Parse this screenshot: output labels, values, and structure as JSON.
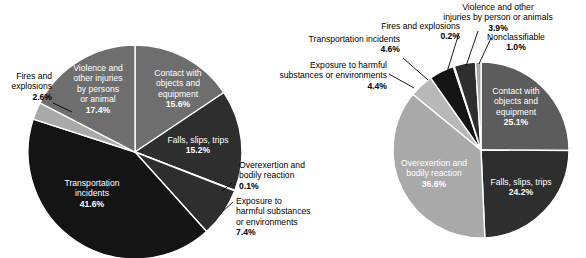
{
  "figure": {
    "name": "fatal-and-nonfatal-occupational-injury-event-distribution",
    "background": "#ffffff"
  },
  "colors": {
    "very_dark": "#141414",
    "dark": "#2e2e2e",
    "mid_dark": "#3d3d3d",
    "mid": "#5c5c5c",
    "mid_light": "#6e6e6e",
    "light": "#a9a9a9",
    "lighter": "#b8b8b8",
    "separator": "#ffffff",
    "text": "#000000",
    "inner_text": "#ffffff"
  },
  "chart_data": [
    {
      "type": "pie",
      "name": "left-pie",
      "title": "",
      "subtitle": "",
      "legend_position": "none",
      "grid": false,
      "center": {
        "x": 135,
        "y": 152
      },
      "radius": 107,
      "start_angle_deg": -90,
      "direction": "clockwise",
      "categories": [
        "Contact with objects and equipment",
        "Falls, slips, trips",
        "Overexertion and bodily reaction",
        "Exposure to harmful substances or environments",
        "Transportation incidents",
        "Fires and explosions",
        "Violence and other injuries by persons or animal"
      ],
      "values": [
        15.6,
        15.2,
        0.1,
        7.4,
        41.6,
        2.6,
        17.4
      ],
      "slices": [
        {
          "label": "Contact with objects and equipment",
          "value": 15.6,
          "display_value": "15.6%",
          "label_lines": [
            "Contact with",
            "objects and",
            "equipment"
          ],
          "color": "#6e6e6e",
          "label_placement": "inside",
          "label_x": 178,
          "label_y": 76,
          "text_anchor": "middle",
          "leader": null
        },
        {
          "label": "Falls, slips, trips",
          "value": 15.2,
          "display_value": "15.2%",
          "label_lines": [
            "Falls, slips, trips"
          ],
          "color": "#2e2e2e",
          "label_placement": "inside",
          "label_x": 198,
          "label_y": 143,
          "text_anchor": "middle",
          "leader": null
        },
        {
          "label": "Overexertion and bodily reaction",
          "value": 0.1,
          "display_value": "0.1%",
          "label_lines": [
            "Overexertion and",
            "bodily reaction"
          ],
          "color": "#a9a9a9",
          "label_placement": "outside",
          "label_x": 239,
          "label_y": 168,
          "text_anchor": "start",
          "leader": {
            "x1": 232,
            "y1": 183,
            "x2": 222,
            "y2": 191
          }
        },
        {
          "label": "Exposure to harmful substances or environments",
          "value": 7.4,
          "display_value": "7.4%",
          "label_lines": [
            "Exposure to",
            "harmful substances",
            "or environments"
          ],
          "color": "#2e2e2e",
          "label_placement": "outside",
          "label_x": 236,
          "label_y": 204,
          "text_anchor": "start",
          "leader": {
            "x1": 233,
            "y1": 202,
            "x2": 222,
            "y2": 212
          }
        },
        {
          "label": "Transportation incidents",
          "value": 41.6,
          "display_value": "41.6%",
          "label_lines": [
            "Transportation",
            "incidents"
          ],
          "color": "#141414",
          "label_placement": "inside",
          "label_x": 92,
          "label_y": 186,
          "text_anchor": "middle",
          "leader": null
        },
        {
          "label": "Fires and explosions",
          "value": 2.6,
          "display_value": "2.6%",
          "label_lines": [
            "Fires and",
            "explosions"
          ],
          "color": "#a9a9a9",
          "label_placement": "outside",
          "label_x": 52,
          "label_y": 79,
          "text_anchor": "end",
          "leader": {
            "x1": 53,
            "y1": 103,
            "x2": 72,
            "y2": 112
          }
        },
        {
          "label": "Violence and other injuries by persons or animal",
          "value": 17.4,
          "display_value": "17.4%",
          "label_lines": [
            "Violence and",
            "other injuries",
            "by persons",
            "or animal"
          ],
          "color": "#6e6e6e",
          "label_placement": "inside",
          "label_x": 98,
          "label_y": 71,
          "text_anchor": "middle",
          "leader": null
        }
      ]
    },
    {
      "type": "pie",
      "name": "right-pie",
      "title": "",
      "subtitle": "",
      "legend_position": "none",
      "grid": false,
      "center": {
        "x": 481,
        "y": 150
      },
      "radius": 88,
      "start_angle_deg": -90,
      "direction": "clockwise",
      "categories": [
        "Contact with objects and equipment",
        "Falls, slips, trips",
        "Overexertion and bodily reaction",
        "Exposure to harmful substances or environments",
        "Transportation incidents",
        "Fires and explosions",
        "Violence and other injuries by person or animals",
        "Nonclassifiable"
      ],
      "values": [
        25.1,
        24.2,
        36.6,
        4.4,
        4.6,
        0.2,
        3.9,
        1.0
      ],
      "slices": [
        {
          "label": "Contact with objects and equipment",
          "value": 25.1,
          "display_value": "25.1%",
          "label_lines": [
            "Contact with",
            "objects and",
            "equipment"
          ],
          "color": "#5c5c5c",
          "label_placement": "inside",
          "label_x": 516,
          "label_y": 94,
          "text_anchor": "middle",
          "leader": null
        },
        {
          "label": "Falls, slips, trips",
          "value": 24.2,
          "display_value": "24.2%",
          "label_lines": [
            "Falls, slips, trips"
          ],
          "color": "#2e2e2e",
          "label_placement": "inside",
          "label_x": 521,
          "label_y": 185,
          "text_anchor": "middle",
          "leader": null
        },
        {
          "label": "Overexertion and bodily reaction",
          "value": 36.6,
          "display_value": "36.6%",
          "label_lines": [
            "Overexertion and",
            "bodily reaction"
          ],
          "color": "#a9a9a9",
          "label_placement": "inside",
          "label_x": 434,
          "label_y": 166,
          "text_anchor": "middle",
          "leader": null
        },
        {
          "label": "Exposure to harmful substances or environments",
          "value": 4.4,
          "display_value": "4.4%",
          "label_lines": [
            "Exposure to harmful",
            "substances or environments"
          ],
          "color": "#b8b8b8",
          "label_placement": "outside",
          "label_x": 387,
          "label_y": 68,
          "text_anchor": "end",
          "leader": {
            "x1": 389,
            "y1": 74,
            "x2": 414,
            "y2": 88
          }
        },
        {
          "label": "Transportation incidents",
          "value": 4.6,
          "display_value": "4.6%",
          "label_lines": [
            "Transportation incidents"
          ],
          "color": "#141414",
          "label_placement": "outside",
          "label_x": 400,
          "label_y": 42,
          "text_anchor": "end",
          "leader": {
            "x1": 403,
            "y1": 58,
            "x2": 428,
            "y2": 80
          }
        },
        {
          "label": "Fires and explosions",
          "value": 0.2,
          "display_value": "0.2%",
          "label_lines": [
            "Fires and explosions"
          ],
          "color": "#5c5c5c",
          "label_placement": "outside",
          "label_x": 460,
          "label_y": 29,
          "text_anchor": "end",
          "leader": {
            "x1": 459,
            "y1": 33,
            "x2": 447,
            "y2": 72
          }
        },
        {
          "label": "Violence and other injuries by person or animals",
          "value": 3.9,
          "display_value": "3.9%",
          "label_lines": [
            "Violence and other",
            "injuries by person or animals"
          ],
          "color": "#2e2e2e",
          "label_placement": "outside",
          "label_x": 498,
          "label_y": 10,
          "text_anchor": "middle",
          "leader": {
            "x1": 478,
            "y1": 31,
            "x2": 466,
            "y2": 66
          }
        },
        {
          "label": "Nonclassifiable",
          "value": 1.0,
          "display_value": "1.0%",
          "label_lines": [
            "Nonclassifiable"
          ],
          "color": "#a9a9a9",
          "label_placement": "outside",
          "label_x": 516,
          "label_y": 40,
          "text_anchor": "middle",
          "leader": {
            "x1": 491,
            "y1": 38,
            "x2": 479,
            "y2": 64
          }
        }
      ]
    }
  ]
}
